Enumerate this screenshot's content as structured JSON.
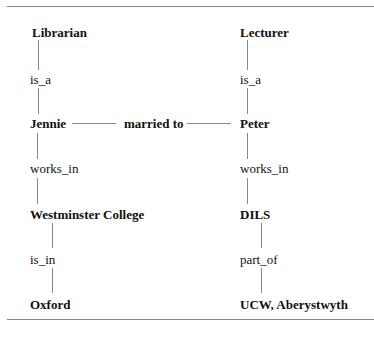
{
  "diagram": {
    "nodes": {
      "librarian": "Librarian",
      "lecturer": "Lecturer",
      "jennie": "Jennie",
      "peter": "Peter",
      "westminster": "Westminster College",
      "dils": "DILS",
      "oxford": "Oxford",
      "ucw": "UCW, Aberystwyth"
    },
    "relations": {
      "is_a_left": "is_a",
      "is_a_right": "is_a",
      "married": "married to",
      "works_in_left": "works_in",
      "works_in_right": "works_in",
      "is_in": "is_in",
      "part_of": "part_of"
    },
    "edges": [
      [
        "Jennie",
        "is_a",
        "Librarian"
      ],
      [
        "Peter",
        "is_a",
        "Lecturer"
      ],
      [
        "Jennie",
        "married to",
        "Peter"
      ],
      [
        "Jennie",
        "works_in",
        "Westminster College"
      ],
      [
        "Peter",
        "works_in",
        "DILS"
      ],
      [
        "Westminster College",
        "is_in",
        "Oxford"
      ],
      [
        "DILS",
        "part_of",
        "UCW, Aberystwyth"
      ]
    ]
  }
}
